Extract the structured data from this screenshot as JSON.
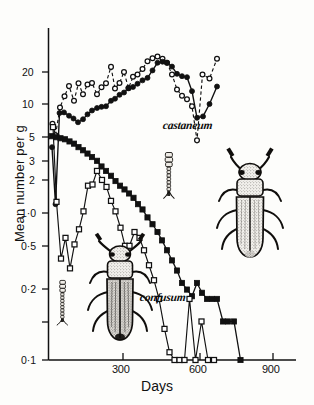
{
  "figure": {
    "background_color": "#fdfdfb",
    "ink_color": "#111111"
  },
  "chart_data": {
    "type": "line",
    "title": "",
    "subtitle": "",
    "xlabel": "Days",
    "ylabel": "Mean number per g",
    "yscale": "log",
    "ylim": [
      0.09,
      26
    ],
    "xlim": [
      0,
      960
    ],
    "grid": false,
    "legend_position": "inline-annotations",
    "ytick_values": [
      20,
      10,
      5,
      3,
      2,
      1.0,
      0.5,
      0.2,
      0.1
    ],
    "ytick_labels": [
      "20",
      "10",
      "5",
      "3",
      "2",
      "1·0",
      "0·5",
      "0·2",
      "0·1"
    ],
    "xtick_values": [
      300,
      600,
      900
    ],
    "xtick_labels": [
      "300",
      "600",
      "900"
    ],
    "annotations": [
      {
        "text": "castaneum",
        "x": 690,
        "y": 7.2,
        "style": "italic"
      },
      {
        "text": "confusum",
        "x": 560,
        "y": 0.36,
        "style": "italic"
      }
    ],
    "series": [
      {
        "name": "castaneum-open-circle",
        "species": "castaneum",
        "marker": "open-circle",
        "linestyle": "dashed",
        "points": [
          [
            18,
            7.0
          ],
          [
            30,
            5.7
          ],
          [
            48,
            9.4
          ],
          [
            66,
            11.5
          ],
          [
            84,
            13.8
          ],
          [
            104,
            10.6
          ],
          [
            122,
            14.5
          ],
          [
            140,
            11.9
          ],
          [
            158,
            14.2
          ],
          [
            176,
            14.6
          ],
          [
            196,
            11.9
          ],
          [
            214,
            13.5
          ],
          [
            232,
            14.5
          ],
          [
            252,
            19.5
          ],
          [
            268,
            13.2
          ],
          [
            286,
            14.6
          ],
          [
            304,
            17.8
          ],
          [
            322,
            13.3
          ],
          [
            340,
            16.3
          ],
          [
            358,
            17.0
          ],
          [
            378,
            18.8
          ],
          [
            398,
            21.6
          ],
          [
            418,
            22.8
          ],
          [
            438,
            23.5
          ],
          [
            458,
            22.6
          ],
          [
            476,
            21.0
          ],
          [
            496,
            17.0
          ],
          [
            516,
            13.0
          ],
          [
            536,
            11.6
          ],
          [
            556,
            10.9
          ],
          [
            576,
            9.6
          ],
          [
            596,
            5.2
          ],
          [
            618,
            17.0
          ],
          [
            646,
            15.8
          ],
          [
            676,
            22.6
          ]
        ]
      },
      {
        "name": "castaneum-filled-circle",
        "species": "castaneum",
        "marker": "filled-circle",
        "linestyle": "solid",
        "points": [
          [
            16,
            4.6
          ],
          [
            30,
            1.65
          ],
          [
            46,
            8.5
          ],
          [
            64,
            8.6
          ],
          [
            84,
            8.1
          ],
          [
            102,
            7.7
          ],
          [
            120,
            7.2
          ],
          [
            140,
            7.6
          ],
          [
            158,
            8.3
          ],
          [
            176,
            8.9
          ],
          [
            196,
            9.3
          ],
          [
            214,
            9.5
          ],
          [
            232,
            9.6
          ],
          [
            252,
            10.6
          ],
          [
            268,
            11.0
          ],
          [
            286,
            11.8
          ],
          [
            304,
            12.3
          ],
          [
            322,
            13.4
          ],
          [
            340,
            13.6
          ],
          [
            358,
            14.4
          ],
          [
            378,
            15.3
          ],
          [
            398,
            16.0
          ],
          [
            418,
            18.3
          ],
          [
            438,
            21.0
          ],
          [
            458,
            21.4
          ],
          [
            476,
            21.0
          ],
          [
            496,
            19.6
          ],
          [
            516,
            17.2
          ],
          [
            536,
            16.5
          ],
          [
            556,
            16.2
          ],
          [
            576,
            12.6
          ],
          [
            596,
            7.8
          ],
          [
            620,
            8.0
          ],
          [
            646,
            10.0
          ],
          [
            676,
            13.7
          ]
        ]
      },
      {
        "name": "confusum-filled-square",
        "species": "confusum",
        "marker": "filled-square",
        "linestyle": "solid",
        "points": [
          [
            16,
            5.6
          ],
          [
            34,
            5.5
          ],
          [
            50,
            5.4
          ],
          [
            68,
            5.3
          ],
          [
            86,
            5.1
          ],
          [
            104,
            4.9
          ],
          [
            122,
            4.6
          ],
          [
            140,
            4.35
          ],
          [
            158,
            4.1
          ],
          [
            176,
            3.85
          ],
          [
            196,
            3.6
          ],
          [
            214,
            3.25
          ],
          [
            232,
            3.0
          ],
          [
            252,
            2.75
          ],
          [
            270,
            2.5
          ],
          [
            288,
            2.3
          ],
          [
            306,
            2.15
          ],
          [
            324,
            2.0
          ],
          [
            342,
            1.85
          ],
          [
            360,
            1.65
          ],
          [
            378,
            1.5
          ],
          [
            398,
            1.3
          ],
          [
            418,
            1.15
          ],
          [
            438,
            1.0
          ],
          [
            456,
            0.86
          ],
          [
            476,
            0.72
          ],
          [
            496,
            0.6
          ],
          [
            516,
            0.5
          ],
          [
            536,
            0.4
          ],
          [
            556,
            0.355
          ],
          [
            576,
            0.315
          ],
          [
            596,
            0.4
          ],
          [
            616,
            0.335
          ],
          [
            636,
            0.3
          ],
          [
            656,
            0.3
          ],
          [
            676,
            0.3
          ],
          [
            700,
            0.2
          ],
          [
            720,
            0.2
          ],
          [
            744,
            0.2
          ],
          [
            770,
            0.1
          ]
        ]
      },
      {
        "name": "confusum-open-square",
        "species": "confusum",
        "marker": "open-square",
        "linestyle": "solid",
        "points": [
          [
            20,
            6.6
          ],
          [
            34,
            1.72
          ],
          [
            52,
            0.62
          ],
          [
            70,
            0.9
          ],
          [
            88,
            0.52
          ],
          [
            106,
            0.8
          ],
          [
            124,
            1.05
          ],
          [
            142,
            1.45
          ],
          [
            160,
            2.3
          ],
          [
            178,
            2.35
          ],
          [
            196,
            3.0
          ],
          [
            216,
            2.55
          ],
          [
            234,
            2.25
          ],
          [
            252,
            1.75
          ],
          [
            270,
            1.45
          ],
          [
            290,
            1.08
          ],
          [
            308,
            0.78
          ],
          [
            326,
            0.78
          ],
          [
            346,
            1.0
          ],
          [
            366,
            0.9
          ],
          [
            384,
            0.72
          ],
          [
            404,
            0.55
          ],
          [
            424,
            0.42
          ],
          [
            444,
            0.3
          ],
          [
            466,
            0.175
          ],
          [
            486,
            0.115
          ],
          [
            506,
            0.1
          ],
          [
            526,
            0.1
          ],
          [
            546,
            0.1
          ],
          [
            566,
            0.3
          ],
          [
            590,
            0.1
          ],
          [
            614,
            0.2
          ],
          [
            640,
            0.1
          ],
          [
            664,
            0.1
          ]
        ]
      }
    ]
  },
  "illustrations": [
    {
      "name": "beetle-castaneum",
      "description": "Tribolium castaneum adult beetle dorsal view"
    },
    {
      "name": "beetle-confusum",
      "description": "Tribolium confusum adult beetle dorsal view"
    },
    {
      "name": "antenna-castaneum",
      "description": "castaneum antenna with abrupt three-segmented club"
    },
    {
      "name": "antenna-confusum",
      "description": "confusum antenna with gradual club"
    }
  ]
}
